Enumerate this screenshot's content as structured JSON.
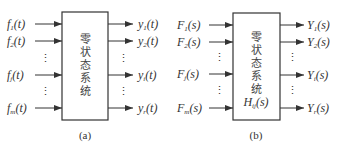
{
  "diagram_a": {
    "caption": "(a)",
    "box_text": [
      "零",
      "状",
      "态",
      "系",
      "统"
    ],
    "inputs": [
      {
        "base": "f",
        "sub": "1",
        "arg": "(t)"
      },
      {
        "base": "f",
        "sub": "2",
        "arg": "(t)"
      },
      {
        "base": "f",
        "sub": "j",
        "arg": "(t)"
      },
      {
        "base": "f",
        "sub": "m",
        "arg": "(t)"
      }
    ],
    "outputs": [
      {
        "base": "y",
        "sub": "1",
        "arg": "(t)"
      },
      {
        "base": "y",
        "sub": "2",
        "arg": "(t)"
      },
      {
        "base": "y",
        "sub": "i",
        "arg": "(t)"
      },
      {
        "base": "y",
        "sub": "r",
        "arg": "(t)"
      }
    ],
    "ellipsis": "⋮"
  },
  "diagram_b": {
    "caption": "(b)",
    "box_text": [
      "零",
      "状",
      "态",
      "系",
      "统"
    ],
    "transfer": {
      "base": "H",
      "sub": "ij",
      "arg": "(s)"
    },
    "inputs": [
      {
        "base": "F",
        "sub": "1",
        "arg": "(s)"
      },
      {
        "base": "F",
        "sub": "2",
        "arg": "(s)"
      },
      {
        "base": "F",
        "sub": "j",
        "arg": "(s)"
      },
      {
        "base": "F",
        "sub": "m",
        "arg": "(s)"
      }
    ],
    "outputs": [
      {
        "base": "Y",
        "sub": "1",
        "arg": "(s)"
      },
      {
        "base": "Y",
        "sub": "2",
        "arg": "(s)"
      },
      {
        "base": "Y",
        "sub": "i",
        "arg": "(s)"
      },
      {
        "base": "Y",
        "sub": "r",
        "arg": "(s)"
      }
    ],
    "ellipsis": "⋮"
  },
  "colors": {
    "line": "#333333",
    "text": "#333333"
  }
}
